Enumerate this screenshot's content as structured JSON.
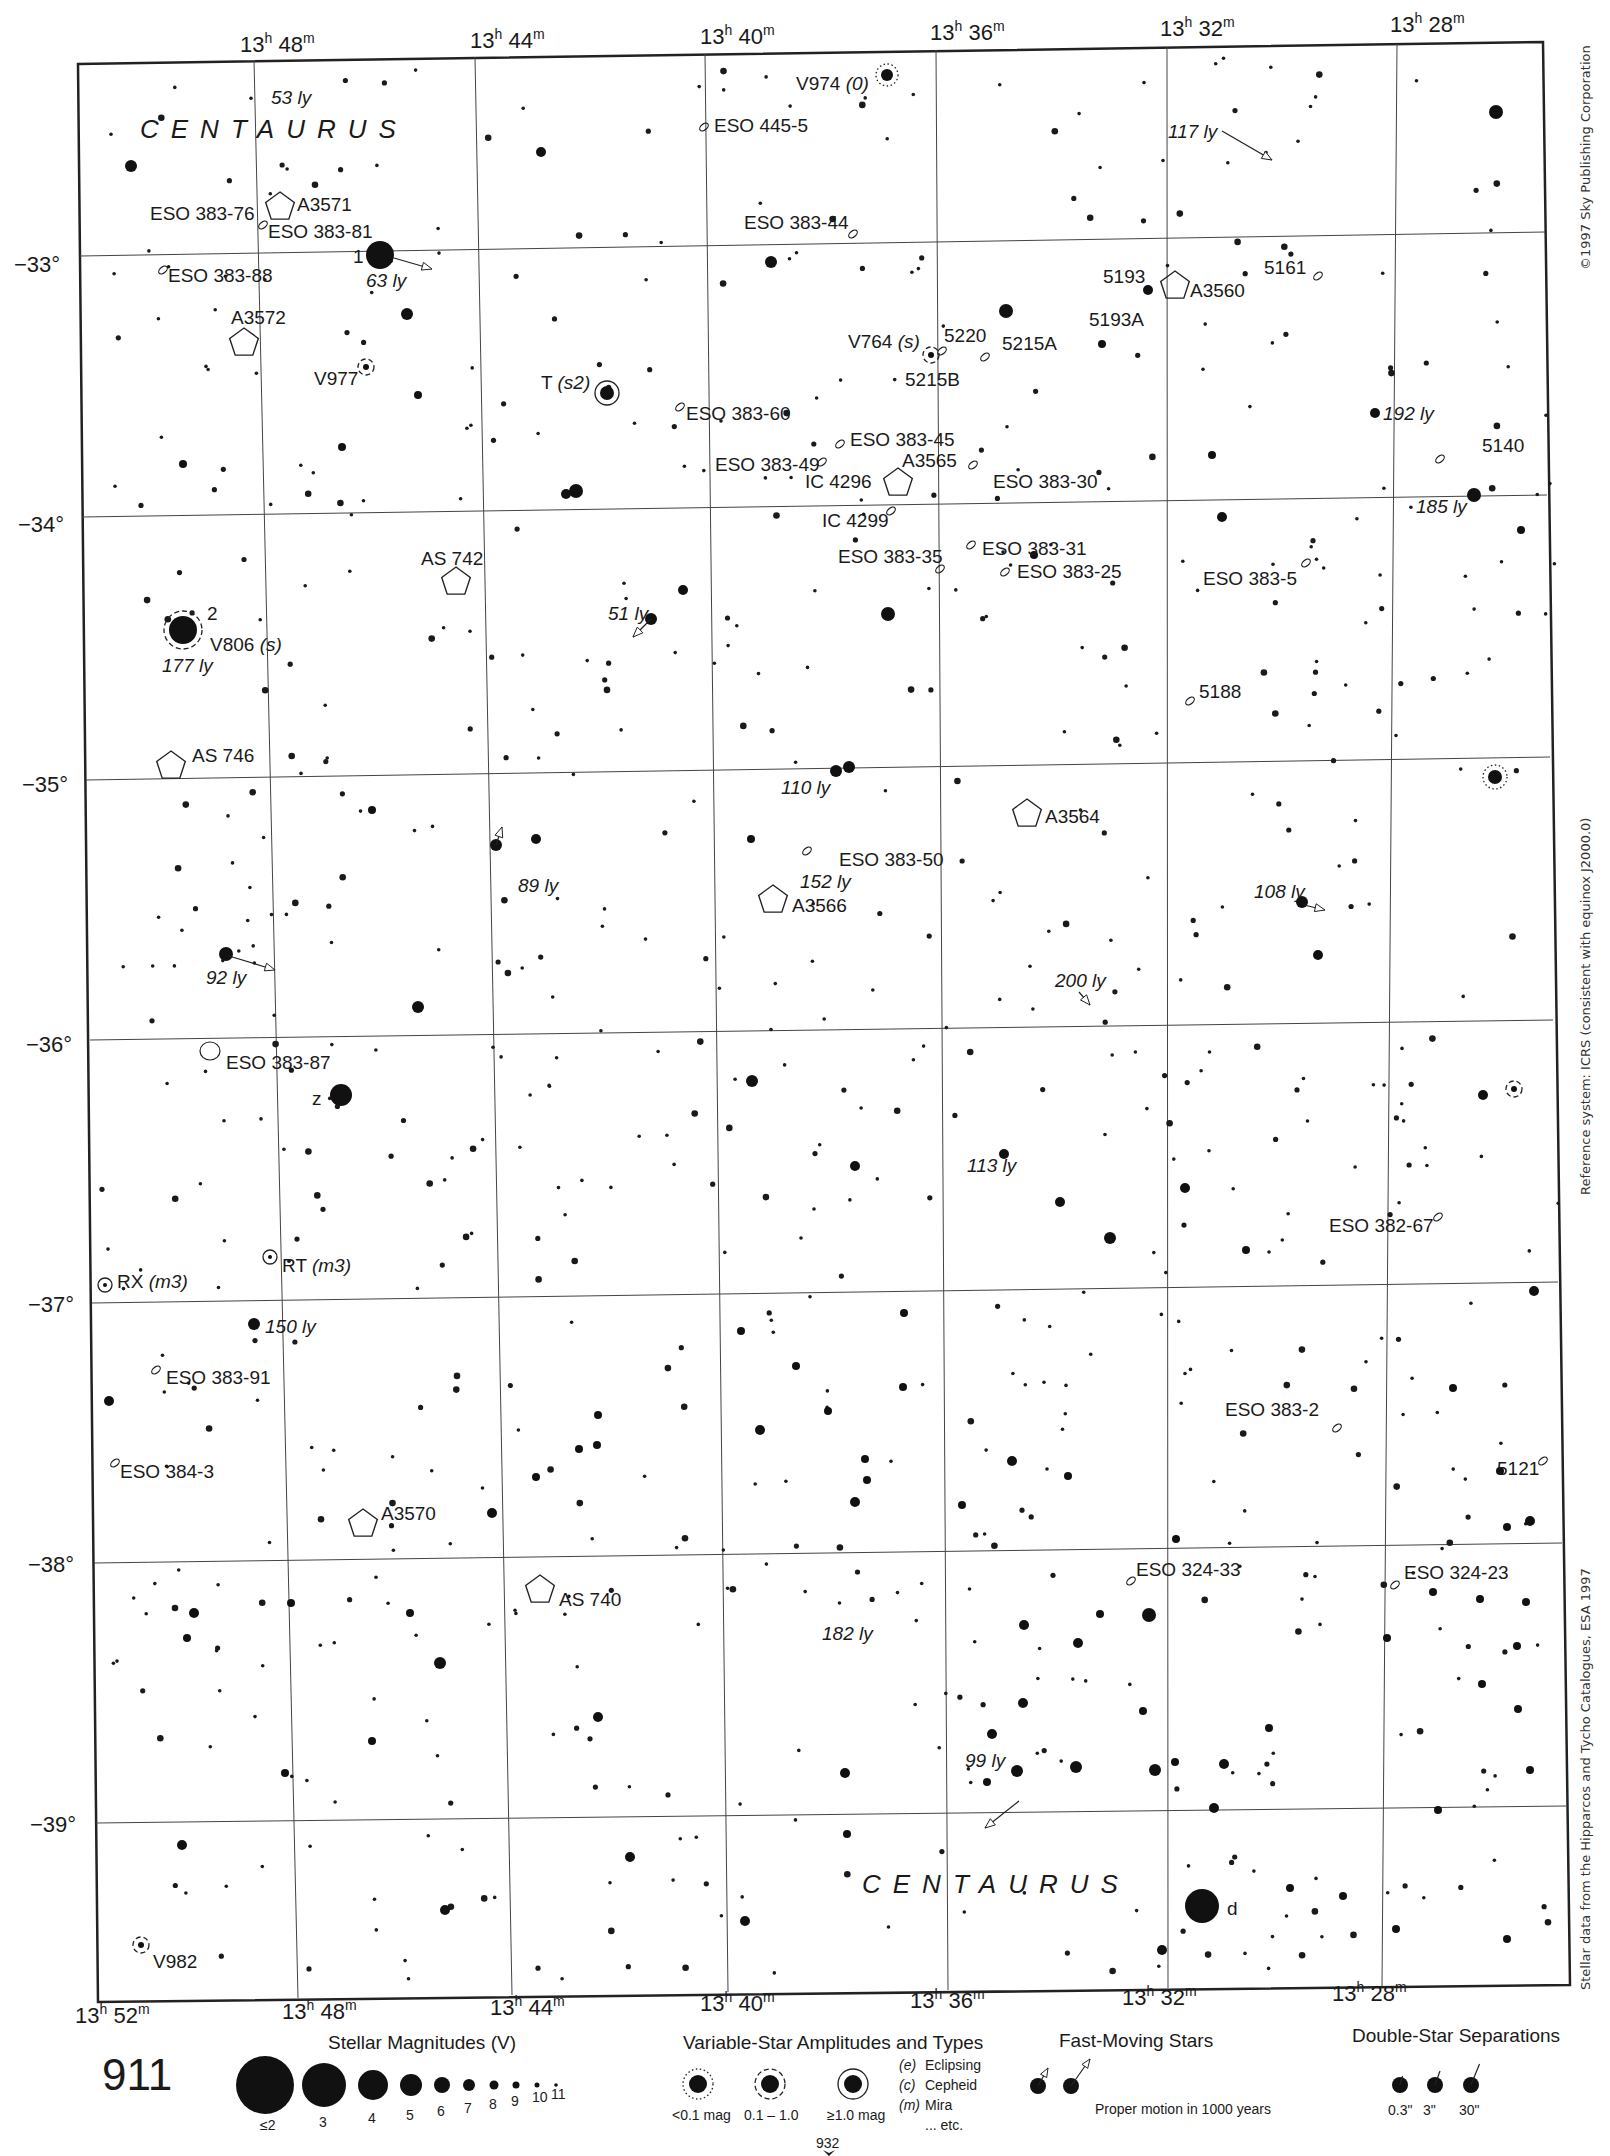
{
  "page": {
    "number": "911",
    "next_page_ref": "932",
    "top_fragment": "30"
  },
  "constellation_labels": [
    {
      "text": "CENTAURUS",
      "x": 140,
      "y": 138
    },
    {
      "text": "CENTAURUS",
      "x": 862,
      "y": 1893
    }
  ],
  "ra_top": [
    {
      "label": "13h 48m",
      "h": "13",
      "m": "48",
      "x": 240,
      "y": 52
    },
    {
      "label": "13h 44m",
      "h": "13",
      "m": "44",
      "x": 470,
      "y": 48
    },
    {
      "label": "13h 40m",
      "h": "13",
      "m": "40",
      "x": 700,
      "y": 44
    },
    {
      "label": "13h 36m",
      "h": "13",
      "m": "36",
      "x": 930,
      "y": 40
    },
    {
      "label": "13h 32m",
      "h": "13",
      "m": "32",
      "x": 1160,
      "y": 36
    },
    {
      "label": "13h 28m",
      "h": "13",
      "m": "28",
      "x": 1390,
      "y": 32
    }
  ],
  "ra_bottom": [
    {
      "label": "13h 52m",
      "h": "13",
      "m": "52",
      "x": 75,
      "y": 2023
    },
    {
      "label": "13h 48m",
      "h": "13",
      "m": "48",
      "x": 282,
      "y": 2019
    },
    {
      "label": "13h 44m",
      "h": "13",
      "m": "44",
      "x": 490,
      "y": 2015
    },
    {
      "label": "13h 40m",
      "h": "13",
      "m": "40",
      "x": 700,
      "y": 2011
    },
    {
      "label": "13h 36m",
      "h": "13",
      "m": "36",
      "x": 910,
      "y": 2008
    },
    {
      "label": "13h 32m",
      "h": "13",
      "m": "32",
      "x": 1122,
      "y": 2005
    },
    {
      "label": "13h 28m",
      "h": "13",
      "m": "28",
      "x": 1332,
      "y": 2001
    }
  ],
  "dec_labels": [
    {
      "label": "−33°",
      "x": 14,
      "y": 272
    },
    {
      "label": "−34°",
      "x": 18,
      "y": 532
    },
    {
      "label": "−35°",
      "x": 22,
      "y": 792
    },
    {
      "label": "−36°",
      "x": 26,
      "y": 1052
    },
    {
      "label": "−37°",
      "x": 28,
      "y": 1312
    },
    {
      "label": "−38°",
      "x": 28,
      "y": 1572
    },
    {
      "label": "−39°",
      "x": 30,
      "y": 1832
    }
  ],
  "frame": {
    "tl": [
      78,
      64
    ],
    "tr": [
      1543,
      42
    ],
    "br": [
      1570,
      1985
    ],
    "bl": [
      98,
      2002
    ]
  },
  "ra_lines": [
    {
      "top": [
        254,
        60
      ],
      "bottom": [
        298,
        1998
      ]
    },
    {
      "top": [
        475,
        57
      ],
      "bottom": [
        512,
        1995
      ]
    },
    {
      "top": [
        705,
        54
      ],
      "bottom": [
        728,
        1992
      ]
    },
    {
      "top": [
        936,
        50
      ],
      "bottom": [
        948,
        1990
      ]
    },
    {
      "top": [
        1167,
        47
      ],
      "bottom": [
        1168,
        1988
      ]
    },
    {
      "top": [
        1397,
        44
      ],
      "bottom": [
        1382,
        1986
      ]
    }
  ],
  "dec_lines": [
    {
      "left": [
        80,
        256
      ],
      "right": [
        1545,
        232
      ]
    },
    {
      "left": [
        82,
        517
      ],
      "right": [
        1547,
        495
      ]
    },
    {
      "left": [
        86,
        780
      ],
      "right": [
        1550,
        757
      ]
    },
    {
      "left": [
        90,
        1040
      ],
      "right": [
        1553,
        1020
      ]
    },
    {
      "left": [
        92,
        1303
      ],
      "right": [
        1558,
        1282
      ]
    },
    {
      "left": [
        94,
        1563
      ],
      "right": [
        1562,
        1543
      ]
    },
    {
      "left": [
        96,
        1823
      ],
      "right": [
        1566,
        1806
      ]
    }
  ],
  "deep_sky": [
    {
      "id": "ESO 445-5",
      "type": "galaxy",
      "x": 704,
      "y": 127,
      "lx": 714,
      "ly": 132
    },
    {
      "id": "ESO 383-76",
      "type": "galaxy-text",
      "lx": 150,
      "ly": 220
    },
    {
      "id": "A3571",
      "type": "cluster",
      "x": 280,
      "y": 207,
      "lx": 297,
      "ly": 211
    },
    {
      "id": "ESO 383-81",
      "type": "galaxy",
      "x": 263,
      "y": 225,
      "lx": 268,
      "ly": 238
    },
    {
      "id": "ESO 383-88",
      "type": "galaxy",
      "x": 163,
      "y": 270,
      "lx": 168,
      "ly": 282
    },
    {
      "id": "ESO 383-44",
      "type": "galaxy",
      "x": 853,
      "y": 234,
      "lx": 744,
      "ly": 229
    },
    {
      "id": "5193",
      "type": "galaxy-text",
      "lx": 1103,
      "ly": 283
    },
    {
      "id": "A3560",
      "type": "cluster",
      "x": 1175,
      "y": 286,
      "lx": 1190,
      "ly": 297
    },
    {
      "id": "5193A",
      "type": "galaxy-text",
      "lx": 1089,
      "ly": 326
    },
    {
      "id": "5161",
      "type": "galaxy",
      "x": 1318,
      "y": 276,
      "lx": 1264,
      "ly": 274
    },
    {
      "id": "A3572",
      "type": "cluster",
      "x": 244,
      "y": 343,
      "lx": 231,
      "ly": 324
    },
    {
      "id": "5220",
      "type": "galaxy",
      "x": 942,
      "y": 351,
      "lx": 944,
      "ly": 342
    },
    {
      "id": "5215A",
      "type": "galaxy",
      "x": 985,
      "y": 357,
      "lx": 1002,
      "ly": 350
    },
    {
      "id": "5215B",
      "type": "galaxy-text",
      "lx": 905,
      "ly": 386
    },
    {
      "id": "V764 (s)",
      "type": "variable-text",
      "lx": 848,
      "ly": 348
    },
    {
      "id": "V977",
      "type": "variable-text",
      "lx": 314,
      "ly": 385
    },
    {
      "id": "T (s2)",
      "type": "variable-text",
      "lx": 541,
      "ly": 389
    },
    {
      "id": "ESO 383-60",
      "type": "galaxy",
      "x": 680,
      "y": 407,
      "lx": 686,
      "ly": 420
    },
    {
      "id": "ESO 383-45",
      "type": "galaxy",
      "x": 840,
      "y": 444,
      "lx": 850,
      "ly": 446
    },
    {
      "id": "5140",
      "type": "galaxy",
      "x": 1440,
      "y": 459,
      "lx": 1482,
      "ly": 452
    },
    {
      "id": "ESO 383-49",
      "type": "galaxy",
      "x": 822,
      "y": 462,
      "lx": 715,
      "ly": 471
    },
    {
      "id": "A3565",
      "type": "cluster",
      "x": 898,
      "y": 483,
      "lx": 902,
      "ly": 467
    },
    {
      "id": "IC 4296",
      "type": "galaxy-text",
      "lx": 805,
      "ly": 488
    },
    {
      "id": "ESO 383-30",
      "type": "galaxy",
      "x": 973,
      "y": 465,
      "lx": 993,
      "ly": 488
    },
    {
      "id": "IC 4299",
      "type": "galaxy",
      "x": 891,
      "y": 511,
      "lx": 822,
      "ly": 527
    },
    {
      "id": "ESO 383-31",
      "type": "galaxy",
      "x": 971,
      "y": 545,
      "lx": 982,
      "ly": 555
    },
    {
      "id": "ESO 383-35",
      "type": "galaxy",
      "x": 940,
      "y": 569,
      "lx": 838,
      "ly": 563
    },
    {
      "id": "ESO 383-25",
      "type": "galaxy",
      "x": 1005,
      "y": 572,
      "lx": 1017,
      "ly": 578
    },
    {
      "id": "ESO 383-5",
      "type": "galaxy",
      "x": 1306,
      "y": 563,
      "lx": 1203,
      "ly": 585
    },
    {
      "id": "AS 742",
      "type": "cluster",
      "x": 456,
      "y": 582,
      "lx": 421,
      "ly": 565
    },
    {
      "id": "5188",
      "type": "galaxy",
      "x": 1190,
      "y": 701,
      "lx": 1199,
      "ly": 698
    },
    {
      "id": "AS 746",
      "type": "cluster",
      "x": 171,
      "y": 766,
      "lx": 192,
      "ly": 762
    },
    {
      "id": "A3564",
      "type": "cluster",
      "x": 1027,
      "y": 814,
      "lx": 1045,
      "ly": 823
    },
    {
      "id": "ESO 383-50",
      "type": "galaxy",
      "x": 807,
      "y": 851,
      "lx": 839,
      "ly": 866
    },
    {
      "id": "A3566",
      "type": "cluster",
      "x": 773,
      "y": 900,
      "lx": 792,
      "ly": 912
    },
    {
      "id": "ESO 383-87",
      "type": "galaxy-large",
      "x": 210,
      "y": 1051,
      "lx": 226,
      "ly": 1069
    },
    {
      "id": "ESO 382-67",
      "type": "galaxy",
      "x": 1438,
      "y": 1217,
      "lx": 1329,
      "ly": 1232
    },
    {
      "id": "RT (m3)",
      "type": "variable-text",
      "lx": 282,
      "ly": 1272
    },
    {
      "id": "RX (m3)",
      "type": "variable-text",
      "lx": 117,
      "ly": 1288
    },
    {
      "id": "ESO 383-91",
      "type": "galaxy",
      "x": 156,
      "y": 1370,
      "lx": 166,
      "ly": 1384
    },
    {
      "id": "ESO 383-2",
      "type": "galaxy",
      "x": 1337,
      "y": 1428,
      "lx": 1225,
      "ly": 1416
    },
    {
      "id": "ESO 384-3",
      "type": "galaxy",
      "x": 115,
      "y": 1463,
      "lx": 120,
      "ly": 1478
    },
    {
      "id": "5121",
      "type": "galaxy",
      "x": 1543,
      "y": 1461,
      "lx": 1497,
      "ly": 1475
    },
    {
      "id": "A3570",
      "type": "cluster",
      "x": 363,
      "y": 1524,
      "lx": 381,
      "ly": 1520
    },
    {
      "id": "ESO 324-33",
      "type": "galaxy",
      "x": 1131,
      "y": 1581,
      "lx": 1136,
      "ly": 1576
    },
    {
      "id": "ESO 324-23",
      "type": "galaxy",
      "x": 1395,
      "y": 1585,
      "lx": 1404,
      "ly": 1579
    },
    {
      "id": "AS 740",
      "type": "cluster",
      "x": 540,
      "y": 1590,
      "lx": 559,
      "ly": 1606
    },
    {
      "id": "V982",
      "type": "variable-text",
      "lx": 153,
      "ly": 1968
    }
  ],
  "named_stars": [
    {
      "label": "1",
      "x": 380,
      "y": 255,
      "r": 14,
      "lx": 353,
      "ly": 263
    },
    {
      "label": "2",
      "x": 183,
      "y": 630,
      "r": 14,
      "lx": 207,
      "ly": 620,
      "variable": "dashed"
    },
    {
      "label": "z",
      "x": 341,
      "y": 1095,
      "r": 11,
      "lx": 312,
      "ly": 1105
    },
    {
      "label": "d",
      "x": 1202,
      "y": 1906,
      "r": 17,
      "lx": 1227,
      "ly": 1915
    }
  ],
  "variable_stars": [
    {
      "name": "V974 (0)",
      "x": 887,
      "y": 75,
      "r": 6,
      "ring": "dotted",
      "lx": 796,
      "ly": 90
    },
    {
      "name": "V806 (s)",
      "x": 183,
      "y": 630,
      "r": 14,
      "ring": "dashed",
      "lx": 210,
      "ly": 651
    },
    {
      "name": "T (s2)",
      "x": 607,
      "y": 393,
      "r": 7,
      "ring": "solid"
    },
    {
      "name": "V764 (s)",
      "x": 931,
      "y": 355,
      "r": 3,
      "ring": "dashed"
    },
    {
      "name": "V977",
      "x": 366,
      "y": 367,
      "r": 3,
      "ring": "dashed"
    },
    {
      "name": "RT (m3)",
      "x": 270,
      "y": 1257,
      "r": 2,
      "ring": "solid"
    },
    {
      "name": "RX (m3)",
      "x": 105,
      "y": 1285,
      "r": 2,
      "ring": "solid"
    },
    {
      "name": "V982",
      "x": 141,
      "y": 1945,
      "r": 3,
      "ring": "dashed"
    },
    {
      "name": "",
      "x": 1495,
      "y": 777,
      "r": 7,
      "ring": "dotted"
    },
    {
      "name": "",
      "x": 1514,
      "y": 1089,
      "r": 3,
      "ring": "dashed"
    }
  ],
  "distance_labels": [
    {
      "text": "53 ly",
      "x": 271,
      "y": 104
    },
    {
      "text": "63 ly",
      "x": 366,
      "y": 287
    },
    {
      "text": "117 ly",
      "x": 1168,
      "y": 138
    },
    {
      "text": "192 ly",
      "x": 1383,
      "y": 420
    },
    {
      "text": "185 ly",
      "x": 1416,
      "y": 513
    },
    {
      "text": "51 ly",
      "x": 608,
      "y": 620
    },
    {
      "text": "177 ly",
      "x": 162,
      "y": 672
    },
    {
      "text": "110 ly",
      "x": 781,
      "y": 794
    },
    {
      "text": "89 ly",
      "x": 518,
      "y": 892
    },
    {
      "text": "152 ly",
      "x": 800,
      "y": 888
    },
    {
      "text": "108 ly",
      "x": 1254,
      "y": 898
    },
    {
      "text": "92 ly",
      "x": 206,
      "y": 984
    },
    {
      "text": "200 ly",
      "x": 1055,
      "y": 987
    },
    {
      "text": "113 ly",
      "x": 967,
      "y": 1172
    },
    {
      "text": "150 ly",
      "x": 265,
      "y": 1333
    },
    {
      "text": "182 ly",
      "x": 822,
      "y": 1640
    },
    {
      "text": "99 ly",
      "x": 965,
      "y": 1767
    }
  ],
  "proper_motion_arrows": [
    {
      "x1": 394,
      "y1": 258,
      "x2": 432,
      "y2": 269
    },
    {
      "x1": 1222,
      "y1": 131,
      "x2": 1272,
      "y2": 160
    },
    {
      "x1": 651,
      "y1": 619,
      "x2": 633,
      "y2": 637
    },
    {
      "x1": 496,
      "y1": 845,
      "x2": 502,
      "y2": 827
    },
    {
      "x1": 229,
      "y1": 956,
      "x2": 275,
      "y2": 970
    },
    {
      "x1": 1304,
      "y1": 905,
      "x2": 1325,
      "y2": 910
    },
    {
      "x1": 1079,
      "y1": 992,
      "x2": 1090,
      "y2": 1005
    },
    {
      "x1": 1019,
      "y1": 1801,
      "x2": 985,
      "y2": 1828
    }
  ],
  "bright_stars": [
    [
      1496,
      112,
      7
    ],
    [
      131,
      166,
      6
    ],
    [
      541,
      152,
      5
    ],
    [
      771,
      262,
      6
    ],
    [
      1006,
      311,
      7
    ],
    [
      407,
      314,
      6
    ],
    [
      1148,
      290,
      5
    ],
    [
      1102,
      344,
      4
    ],
    [
      1375,
      413,
      5
    ],
    [
      576,
      491,
      7
    ],
    [
      1474,
      495,
      7
    ],
    [
      1222,
      517,
      5
    ],
    [
      183,
      464,
      4
    ],
    [
      342,
      447,
      4
    ],
    [
      683,
      590,
      5
    ],
    [
      888,
      614,
      7
    ],
    [
      651,
      619,
      6
    ],
    [
      1034,
      555,
      4
    ],
    [
      836,
      771,
      6
    ],
    [
      849,
      767,
      6
    ],
    [
      536,
      839,
      5
    ],
    [
      496,
      845,
      6
    ],
    [
      372,
      810,
      4
    ],
    [
      751,
      839,
      4
    ],
    [
      1302,
      902,
      6
    ],
    [
      1318,
      955,
      5
    ],
    [
      226,
      954,
      7
    ],
    [
      418,
      1007,
      6
    ],
    [
      1110,
      1238,
      6
    ],
    [
      1004,
      1154,
      5
    ],
    [
      752,
      1081,
      6
    ],
    [
      855,
      1166,
      5
    ],
    [
      1060,
      1202,
      5
    ],
    [
      1185,
      1188,
      5
    ],
    [
      1246,
      1250,
      4
    ],
    [
      1483,
      1095,
      5
    ],
    [
      254,
      1324,
      6
    ],
    [
      109,
      1401,
      5
    ],
    [
      1534,
      1291,
      5
    ],
    [
      1530,
      1521,
      5
    ],
    [
      1149,
      1615,
      7
    ],
    [
      1024,
      1625,
      5
    ],
    [
      1017,
      1771,
      6
    ],
    [
      1076,
      1767,
      6
    ],
    [
      1155,
      1770,
      6
    ],
    [
      1224,
      1764,
      5
    ],
    [
      1214,
      1808,
      5
    ],
    [
      845,
      1773,
      5
    ],
    [
      440,
      1663,
      6
    ],
    [
      194,
      1613,
      5
    ],
    [
      598,
      1717,
      5
    ],
    [
      1023,
      1703,
      5
    ],
    [
      987,
      1782,
      4
    ],
    [
      992,
      1734,
      5
    ],
    [
      1162,
      1950,
      5
    ],
    [
      372,
      1741,
      4
    ],
    [
      285,
      1773,
      4
    ],
    [
      182,
      1845,
      5
    ],
    [
      445,
      1910,
      5
    ],
    [
      630,
      1857,
      5
    ],
    [
      745,
      1921,
      5
    ],
    [
      847,
      1834,
      4
    ],
    [
      410,
      1613,
      4
    ],
    [
      187,
      1638,
      4
    ],
    [
      291,
      1603,
      4
    ],
    [
      1480,
      1599,
      4
    ],
    [
      1482,
      1684,
      4
    ],
    [
      418,
      395,
      4
    ],
    [
      566,
      494,
      5
    ],
    [
      1212,
      455,
      4
    ],
    [
      1521,
      530,
      4
    ],
    [
      760,
      1430,
      5
    ],
    [
      1012,
      1461,
      5
    ],
    [
      865,
      1459,
      4
    ],
    [
      903,
      1387,
      4
    ],
    [
      962,
      1505,
      4
    ],
    [
      1068,
      1476,
      4
    ],
    [
      1176,
      1539,
      4
    ],
    [
      1453,
      1388,
      4
    ],
    [
      1500,
      1471,
      4
    ],
    [
      1507,
      1527,
      4
    ],
    [
      796,
      1366,
      4
    ],
    [
      828,
      1411,
      4
    ],
    [
      904,
      1313,
      4
    ],
    [
      741,
      1331,
      4
    ],
    [
      579,
      1449,
      4
    ],
    [
      597,
      1445,
      4
    ],
    [
      598,
      1415,
      4
    ],
    [
      492,
      1513,
      5
    ],
    [
      536,
      1477,
      4
    ],
    [
      867,
      1480,
      4
    ],
    [
      855,
      1502,
      5
    ],
    [
      1100,
      1614,
      4
    ],
    [
      1078,
      1643,
      5
    ],
    [
      1143,
      1711,
      4
    ],
    [
      1175,
      1762,
      4
    ],
    [
      1269,
      1728,
      4
    ],
    [
      1433,
      1592,
      4
    ],
    [
      1438,
      1810,
      4
    ],
    [
      1343,
      1896,
      4
    ],
    [
      1290,
      1888,
      4
    ],
    [
      1396,
      1929,
      4
    ],
    [
      1507,
      1939,
      4
    ],
    [
      1530,
      1770,
      4
    ],
    [
      1518,
      1709,
      4
    ],
    [
      1517,
      1646,
      4
    ],
    [
      1526,
      1602,
      4
    ],
    [
      1387,
      1638,
      4
    ]
  ],
  "faint_star_seed": 911,
  "copyright": "©1997 Sky Publishing Corporation",
  "reference_system": "Reference system: ICRS (consistent with equinox J2000.0)",
  "data_source": "Stellar data from the Hipparcos and Tycho Catalogues, ESA 1997",
  "legend": {
    "magnitudes": {
      "title": "Stellar Magnitudes (V)",
      "items": [
        {
          "label": "≤2",
          "r": 29
        },
        {
          "label": "3",
          "r": 22
        },
        {
          "label": "4",
          "r": 15
        },
        {
          "label": "5",
          "r": 11
        },
        {
          "label": "6",
          "r": 8
        },
        {
          "label": "7",
          "r": 6
        },
        {
          "label": "8",
          "r": 4.5
        },
        {
          "label": "9",
          "r": 3.5
        },
        {
          "label": "10",
          "r": 2.5
        },
        {
          "label": "11",
          "r": 1.8
        }
      ]
    },
    "variables": {
      "title": "Variable-Star Amplitudes and Types",
      "items": [
        {
          "label": "<0.1 mag",
          "ring": "dotted"
        },
        {
          "label": "0.1 – 1.0",
          "ring": "dashed"
        },
        {
          "label": "≥1.0 mag",
          "ring": "solid"
        }
      ],
      "types": [
        {
          "code": "(e)",
          "name": "Eclipsing"
        },
        {
          "code": "(c)",
          "name": "Cepheid"
        },
        {
          "code": "(m)",
          "name": "Mira"
        },
        {
          "code": "",
          "name": "... etc."
        }
      ]
    },
    "fast_moving": {
      "title": "Fast-Moving Stars",
      "caption": "Proper motion in 1000 years"
    },
    "double_stars": {
      "title": "Double-Star Separations",
      "items": [
        {
          "label": "0.3\""
        },
        {
          "label": "3\""
        },
        {
          "label": "30\""
        }
      ]
    }
  }
}
